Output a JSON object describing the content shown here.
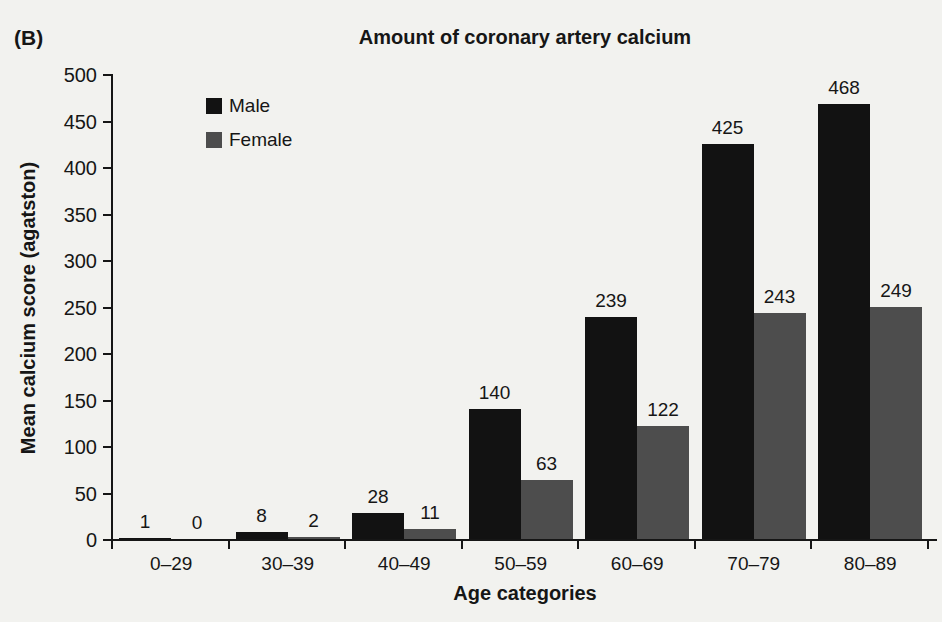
{
  "panel_label": "(B)",
  "colors": {
    "background": "#f2f2ef",
    "text": "#161616",
    "axis": "#161616",
    "male_bar": "#121212",
    "female_bar": "#4d4d4d"
  },
  "chart_data": {
    "type": "bar",
    "title": "Amount of coronary artery calcium",
    "xlabel": "Age categories",
    "ylabel": "Mean calcium score (agatston)",
    "categories": [
      "0–29",
      "30–39",
      "40–49",
      "50–59",
      "60–69",
      "70–79",
      "80–89"
    ],
    "series": [
      {
        "name": "Male",
        "color": "#121212",
        "values": [
          1,
          8,
          28,
          140,
          239,
          425,
          468
        ]
      },
      {
        "name": "Female",
        "color": "#4d4d4d",
        "values": [
          0,
          2,
          11,
          63,
          122,
          243,
          249
        ]
      }
    ],
    "ylim": [
      0,
      500
    ],
    "ytick_step": 50,
    "yticks": [
      0,
      50,
      100,
      150,
      200,
      250,
      300,
      350,
      400,
      450,
      500
    ],
    "grid": false,
    "legend_position": "upper-left-inside",
    "bar_value_labels": true
  }
}
